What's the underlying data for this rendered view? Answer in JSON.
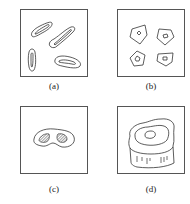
{
  "figure": {
    "panels": [
      {
        "id": "a",
        "label": "(a)",
        "content": "four elongated outlined particles with inner contour lines"
      },
      {
        "id": "b",
        "label": "(b)",
        "content": "four pentagonal outlines each containing a small inner polygon"
      },
      {
        "id": "c",
        "label": "(c)",
        "content": "bean-shaped outline containing two hatched regions"
      },
      {
        "id": "d",
        "label": "(d)",
        "content": "3D cylindrical block with irregular top contours and vertical tick marks on side"
      }
    ],
    "colors": {
      "stroke": "#333333",
      "background": "#ffffff",
      "frame": "#555555"
    }
  }
}
